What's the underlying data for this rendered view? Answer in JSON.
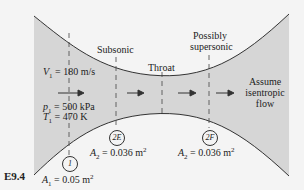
{
  "figure_tag": "E9.4",
  "colors": {
    "background": "#f4f4f4",
    "nozzle_fill": "#d6d6d6",
    "wall_line": "#333333",
    "dashed_line": "#444444",
    "arrow": "#333333"
  },
  "regions": {
    "subsonic_label": "Subsonic",
    "throat_label": "Throat",
    "supersonic_label_line1": "Possibly",
    "supersonic_label_line2": "supersonic",
    "assume_line1": "Assume",
    "assume_line2": "isentropic",
    "assume_line3": "flow"
  },
  "inlet": {
    "velocity_symbol": "V",
    "velocity_sub": "1",
    "velocity_value": " = 180 m/s",
    "pressure_symbol": "p",
    "pressure_sub": "1",
    "pressure_value": " = 500 kPa",
    "temperature_symbol": "T",
    "temperature_sub": "1",
    "temperature_value": " = 470 K"
  },
  "stations": [
    {
      "id": "1",
      "area_symbol": "A",
      "area_sub": "1",
      "area_value": " = 0.05 m",
      "area_exp": "2"
    },
    {
      "id": "2E",
      "area_symbol": "A",
      "area_sub": "2",
      "area_value": " = 0.036 m",
      "area_exp": "2"
    },
    {
      "id": "2F",
      "area_symbol": "A",
      "area_sub": "2",
      "area_value": " = 0.036 m",
      "area_exp": "2"
    }
  ]
}
